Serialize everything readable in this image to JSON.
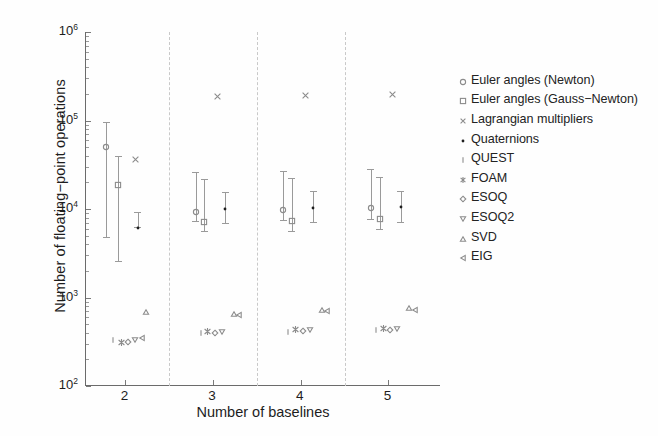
{
  "chart_data": {
    "type": "scatter",
    "title": "",
    "xlabel": "Number of baselines",
    "ylabel": "Number of floating−point operations",
    "xscale": "linear",
    "yscale": "log",
    "xlim": [
      1.55,
      5.6
    ],
    "ylim": [
      100,
      1000000
    ],
    "xticks": [
      "2",
      "3",
      "4",
      "5"
    ],
    "xtick_values": [
      2,
      3,
      4,
      5
    ],
    "yticks": [
      "10²",
      "10³",
      "10⁴",
      "10⁵",
      "10⁶"
    ],
    "ytick_values": [
      100,
      1000,
      10000,
      100000,
      1000000
    ],
    "grid": false,
    "group_separators": [
      2.5,
      3.5,
      4.5
    ],
    "legend_position": "outside-right",
    "legend": [
      {
        "label": "Euler angles (Newton)",
        "marker": "circle-open"
      },
      {
        "label": "Euler angles (Gauss−Newton)",
        "marker": "square-open"
      },
      {
        "label": "Lagrangian multipliers",
        "marker": "cross-x"
      },
      {
        "label": "Quaternions",
        "marker": "dot-filled"
      },
      {
        "label": "QUEST",
        "marker": "vertical-bar"
      },
      {
        "label": "FOAM",
        "marker": "asterisk"
      },
      {
        "label": "ESOQ",
        "marker": "diamond-open"
      },
      {
        "label": "ESOQ2",
        "marker": "triangle-down-open"
      },
      {
        "label": "SVD",
        "marker": "triangle-up-open"
      },
      {
        "label": "EIG",
        "marker": "triangle-left-open"
      }
    ],
    "series": [
      {
        "name": "Euler angles (Newton)",
        "marker": "circle-open",
        "points": [
          {
            "x": 1.78,
            "y": 58000,
            "ylow": 4800,
            "yhigh": 95000
          },
          {
            "x": 2.8,
            "y": 10800,
            "ylow": 7400,
            "yhigh": 26000
          },
          {
            "x": 3.8,
            "y": 11500,
            "ylow": 7600,
            "yhigh": 27000
          },
          {
            "x": 4.8,
            "y": 12000,
            "ylow": 7800,
            "yhigh": 28000
          }
        ]
      },
      {
        "name": "Euler angles (Gauss−Newton)",
        "marker": "square-open",
        "points": [
          {
            "x": 1.92,
            "y": 22000,
            "ylow": 2600,
            "yhigh": 40000
          },
          {
            "x": 2.9,
            "y": 8300,
            "ylow": 5600,
            "yhigh": 22000
          },
          {
            "x": 3.9,
            "y": 8600,
            "ylow": 5700,
            "yhigh": 22500
          },
          {
            "x": 4.9,
            "y": 8900,
            "ylow": 5900,
            "yhigh": 23000
          }
        ]
      },
      {
        "name": "Lagrangian multipliers",
        "marker": "cross-x",
        "points": [
          {
            "x": 2.12,
            "y": 41000
          },
          {
            "x": 3.05,
            "y": 215000
          },
          {
            "x": 4.05,
            "y": 220000
          },
          {
            "x": 5.05,
            "y": 225000
          }
        ]
      },
      {
        "name": "Quaternions",
        "marker": "dot-filled",
        "points": [
          {
            "x": 2.14,
            "y": 7200,
            "ylow": 6200,
            "yhigh": 9200
          },
          {
            "x": 3.14,
            "y": 11800,
            "ylow": 7000,
            "yhigh": 15500
          },
          {
            "x": 4.14,
            "y": 12000,
            "ylow": 7100,
            "yhigh": 15800
          },
          {
            "x": 5.14,
            "y": 12200,
            "ylow": 7200,
            "yhigh": 16000
          }
        ]
      },
      {
        "name": "QUEST",
        "marker": "vertical-bar",
        "points": [
          {
            "x": 1.86,
            "y": 390
          },
          {
            "x": 2.86,
            "y": 470
          },
          {
            "x": 3.86,
            "y": 480
          },
          {
            "x": 4.86,
            "y": 500
          }
        ]
      },
      {
        "name": "FOAM",
        "marker": "asterisk",
        "points": [
          {
            "x": 1.95,
            "y": 350
          },
          {
            "x": 2.94,
            "y": 470
          },
          {
            "x": 3.94,
            "y": 490
          },
          {
            "x": 4.94,
            "y": 505
          }
        ]
      },
      {
        "name": "ESOQ",
        "marker": "diamond-open",
        "points": [
          {
            "x": 2.03,
            "y": 370
          },
          {
            "x": 3.02,
            "y": 470
          },
          {
            "x": 4.02,
            "y": 490
          },
          {
            "x": 5.02,
            "y": 505
          }
        ]
      },
      {
        "name": "ESOQ2",
        "marker": "triangle-down-open",
        "points": [
          {
            "x": 2.11,
            "y": 390
          },
          {
            "x": 3.1,
            "y": 480
          },
          {
            "x": 4.1,
            "y": 500
          },
          {
            "x": 5.1,
            "y": 515
          }
        ]
      },
      {
        "name": "SVD",
        "marker": "triangle-up-open",
        "points": [
          {
            "x": 2.23,
            "y": 800
          },
          {
            "x": 3.24,
            "y": 760
          },
          {
            "x": 4.24,
            "y": 850
          },
          {
            "x": 5.24,
            "y": 880
          }
        ]
      },
      {
        "name": "EIG",
        "marker": "triangle-left-open",
        "points": [
          {
            "x": 2.19,
            "y": 410
          },
          {
            "x": 3.3,
            "y": 740
          },
          {
            "x": 4.3,
            "y": 820
          },
          {
            "x": 5.3,
            "y": 850
          }
        ]
      }
    ],
    "colors": {
      "marker": "#8c8c8c",
      "marker_dark": "#1e1e1e",
      "axis": "#6b6b6b",
      "separator": "#c9c9c9",
      "text": "#1d1d1d",
      "background": "#fefefe"
    }
  }
}
